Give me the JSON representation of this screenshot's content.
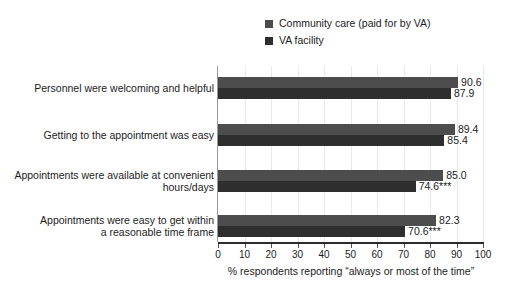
{
  "chart_data": {
    "type": "bar",
    "orientation": "horizontal",
    "title": "",
    "xlabel": "% respondents reporting “always or most of the time”",
    "ylabel": "",
    "xlim": [
      0,
      100
    ],
    "xticks": [
      0,
      10,
      20,
      30,
      40,
      50,
      60,
      70,
      80,
      90,
      100
    ],
    "grid": true,
    "legend_position": "top-center",
    "categories": [
      "Personnel were welcoming and helpful",
      "Getting to the appointment was easy",
      "Appointments were available at convenient hours/days",
      "Appointments were easy to get within a reasonable time frame"
    ],
    "category_lines": [
      [
        "Personnel were welcoming and helpful"
      ],
      [
        "Getting to the appointment was easy"
      ],
      [
        "Appointments were available at convenient",
        "hours/days"
      ],
      [
        "Appointments were easy to get within",
        "a reasonable time frame"
      ]
    ],
    "series": [
      {
        "name": "Community care (paid for by VA)",
        "color": "#4d4d4d",
        "values": [
          90.6,
          89.4,
          85.0,
          82.3
        ],
        "labels": [
          "90.6",
          "89.4",
          "85.0",
          "82.3"
        ]
      },
      {
        "name": "VA facility",
        "color": "#2e2e2e",
        "values": [
          87.9,
          85.4,
          74.6,
          70.6
        ],
        "labels": [
          "87.9",
          "85.4",
          "74.6***",
          "70.6***"
        ]
      }
    ],
    "significance_note": "*** indicates statistically significant difference"
  },
  "legend": {
    "items": [
      {
        "label": "Community care (paid for by VA)",
        "color": "#4d4d4d"
      },
      {
        "label": "VA facility",
        "color": "#2e2e2e"
      }
    ]
  },
  "axis": {
    "title": "% respondents reporting “always or most of the time”",
    "ticks": [
      "0",
      "10",
      "20",
      "30",
      "40",
      "50",
      "60",
      "70",
      "80",
      "90",
      "100"
    ]
  }
}
